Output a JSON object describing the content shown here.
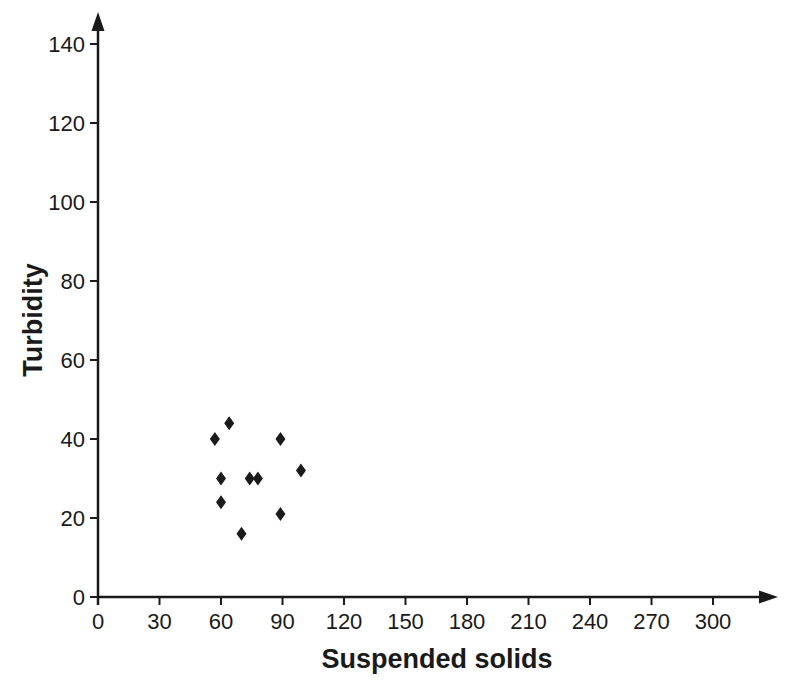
{
  "page": {
    "background_color": "#ffffff",
    "ink_color": "#1a1a1a"
  },
  "chart_data": {
    "type": "scatter",
    "title": "",
    "xlabel": "Suspended solids",
    "ylabel": "Turbidity",
    "x_ticks": [
      0,
      30,
      60,
      90,
      120,
      150,
      180,
      210,
      240,
      270,
      300
    ],
    "y_ticks": [
      0,
      20,
      40,
      60,
      80,
      100,
      120,
      140
    ],
    "xlim": [
      0,
      330
    ],
    "ylim": [
      0,
      148
    ],
    "grid": false,
    "legend": "none",
    "marker": "diamond",
    "marker_color": "#1a1a1a",
    "axis_color": "#1a1a1a",
    "points": [
      {
        "x": 57,
        "y": 40
      },
      {
        "x": 64,
        "y": 44
      },
      {
        "x": 60,
        "y": 30
      },
      {
        "x": 60,
        "y": 24
      },
      {
        "x": 70,
        "y": 16
      },
      {
        "x": 74,
        "y": 30
      },
      {
        "x": 78,
        "y": 30
      },
      {
        "x": 89,
        "y": 40
      },
      {
        "x": 89,
        "y": 21
      },
      {
        "x": 99,
        "y": 32
      }
    ]
  }
}
